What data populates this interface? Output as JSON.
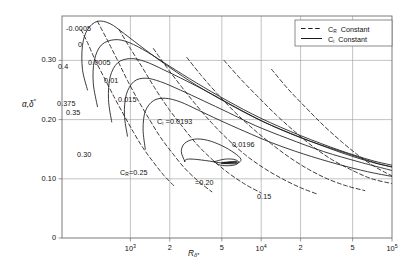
{
  "figure": {
    "kind": "neutral-stability-diagram",
    "background": "#ffffff",
    "line_color": "#1a1a1a",
    "grid_color": "#9a9a9a",
    "frame_color": "#6e6e6e"
  },
  "axes": {
    "y_title": "αᵢδ*",
    "y_title_plain": "α,δ*",
    "x_title_main": "R",
    "x_title_sub": "δ*",
    "y_ticks": [
      "0",
      "0.10",
      "0.20",
      "0.30"
    ],
    "y_tick_values": [
      0,
      0.1,
      0.2,
      0.3
    ],
    "y_min": 0,
    "y_max": 0.375,
    "x_tick_labels": [
      "10³",
      "2",
      "5",
      "10⁴",
      "2",
      "5",
      "10⁵"
    ],
    "x_tick_values": [
      1000,
      2000,
      5000,
      10000,
      20000,
      50000,
      100000
    ],
    "x_min": 300,
    "x_max": 100000,
    "x_scale": "log",
    "grid": true
  },
  "legend": {
    "entries": [
      {
        "style": "dashed",
        "symbol": "C",
        "sub": "R",
        "text": "Constant"
      },
      {
        "style": "solid",
        "symbol": "C",
        "sub": "i",
        "text": "Constant"
      }
    ]
  },
  "curve_labels": {
    "ci_solid": [
      "-0.0005",
      "0",
      "0.0005",
      "0.01",
      "0.015"
    ],
    "ci_named": "Cᵢ =0.0193",
    "ci_inner": "0.0196",
    "cr_dashed": [
      "0.4",
      "0.375",
      "0.35",
      "0.30"
    ],
    "cr_named": "Cʀ=0.25",
    "cr_more": [
      "=0.20",
      "0.15"
    ]
  },
  "chart_data": {
    "type": "line",
    "title": "",
    "xlabel": "R_delta*",
    "ylabel": "alpha,delta*",
    "xlim": [
      300,
      100000
    ],
    "ylim": [
      0,
      0.375
    ],
    "xscale": "log",
    "grid": true,
    "legend": [
      "C_R Constant (dashed)",
      "C_i Constant (solid)"
    ],
    "series": [
      {
        "name": "C_i = -0.0005",
        "style": "solid",
        "label": "-0.0005",
        "points": [
          [
            470,
            0.25
          ],
          [
            430,
            0.285
          ],
          [
            430,
            0.325
          ],
          [
            470,
            0.352
          ],
          [
            560,
            0.366
          ],
          [
            700,
            0.362
          ],
          [
            900,
            0.345
          ],
          [
            1300,
            0.318
          ],
          [
            2000,
            0.288
          ],
          [
            3200,
            0.258
          ],
          [
            5500,
            0.228
          ],
          [
            10000,
            0.198
          ],
          [
            20000,
            0.17
          ],
          [
            40000,
            0.145
          ],
          [
            70000,
            0.128
          ],
          [
            100000,
            0.12
          ]
        ]
      },
      {
        "name": "C_i = 0",
        "style": "solid",
        "label": "0",
        "points": [
          [
            560,
            0.222
          ],
          [
            520,
            0.262
          ],
          [
            530,
            0.3
          ],
          [
            600,
            0.326
          ],
          [
            760,
            0.335
          ],
          [
            980,
            0.33
          ],
          [
            1350,
            0.314
          ],
          [
            2000,
            0.29
          ],
          [
            3200,
            0.262
          ],
          [
            5500,
            0.232
          ],
          [
            10000,
            0.202
          ],
          [
            20000,
            0.173
          ],
          [
            40000,
            0.148
          ],
          [
            70000,
            0.131
          ],
          [
            100000,
            0.123
          ]
        ]
      },
      {
        "name": "C_i = 0.0005",
        "style": "solid",
        "label": "0.0005",
        "points": [
          [
            720,
            0.196
          ],
          [
            680,
            0.234
          ],
          [
            700,
            0.272
          ],
          [
            800,
            0.296
          ],
          [
            1000,
            0.303
          ],
          [
            1300,
            0.298
          ],
          [
            1800,
            0.284
          ],
          [
            2700,
            0.265
          ],
          [
            4200,
            0.243
          ],
          [
            7000,
            0.216
          ],
          [
            12000,
            0.19
          ],
          [
            22000,
            0.166
          ],
          [
            45000,
            0.143
          ],
          [
            75000,
            0.127
          ],
          [
            100000,
            0.12
          ]
        ]
      },
      {
        "name": "C_i = 0.01",
        "style": "solid",
        "label": "0.01",
        "points": [
          [
            950,
            0.172
          ],
          [
            900,
            0.208
          ],
          [
            930,
            0.242
          ],
          [
            1060,
            0.264
          ],
          [
            1300,
            0.27
          ],
          [
            1700,
            0.264
          ],
          [
            2400,
            0.25
          ],
          [
            3600,
            0.232
          ],
          [
            5600,
            0.212
          ],
          [
            9000,
            0.19
          ],
          [
            16000,
            0.168
          ],
          [
            30000,
            0.146
          ],
          [
            55000,
            0.129
          ],
          [
            85000,
            0.118
          ],
          [
            100000,
            0.114
          ]
        ]
      },
      {
        "name": "C_i = 0.015",
        "style": "solid",
        "label": "0.015",
        "points": [
          [
            1300,
            0.15
          ],
          [
            1250,
            0.184
          ],
          [
            1300,
            0.214
          ],
          [
            1500,
            0.232
          ],
          [
            1850,
            0.236
          ],
          [
            2400,
            0.23
          ],
          [
            3300,
            0.216
          ],
          [
            4800,
            0.199
          ],
          [
            7500,
            0.18
          ],
          [
            12000,
            0.161
          ],
          [
            21000,
            0.142
          ],
          [
            38000,
            0.125
          ],
          [
            65000,
            0.112
          ],
          [
            100000,
            0.104
          ]
        ]
      },
      {
        "name": "C_i = 0.0193",
        "style": "solid",
        "label": "C_i =0.0193",
        "points": [
          [
            2600,
            0.13
          ],
          [
            2450,
            0.146
          ],
          [
            2600,
            0.16
          ],
          [
            3100,
            0.167
          ],
          [
            3900,
            0.165
          ],
          [
            5000,
            0.156
          ],
          [
            6200,
            0.144
          ],
          [
            7000,
            0.133
          ],
          [
            6500,
            0.126
          ],
          [
            5200,
            0.126
          ],
          [
            4000,
            0.13
          ],
          [
            3100,
            0.133
          ],
          [
            2700,
            0.133
          ],
          [
            2600,
            0.13
          ]
        ]
      },
      {
        "name": "C_i = 0.0196",
        "style": "solid",
        "label": "0.0196",
        "points": [
          [
            4400,
            0.129
          ],
          [
            5200,
            0.133
          ],
          [
            6100,
            0.133
          ],
          [
            6700,
            0.129
          ],
          [
            6400,
            0.124
          ],
          [
            5500,
            0.122
          ],
          [
            4700,
            0.124
          ],
          [
            4400,
            0.129
          ]
        ]
      },
      {
        "name": "C_R = 0.4",
        "style": "dashed",
        "label": "0.4",
        "points": [
          [
            420,
            0.352
          ],
          [
            470,
            0.33
          ],
          [
            540,
            0.3
          ],
          [
            640,
            0.268
          ],
          [
            760,
            0.236
          ],
          [
            900,
            0.206
          ],
          [
            1060,
            0.178
          ],
          [
            1250,
            0.152
          ],
          [
            1500,
            0.128
          ],
          [
            1800,
            0.106
          ],
          [
            2200,
            0.086
          ]
        ]
      },
      {
        "name": "C_R = 0.375",
        "style": "dashed",
        "label": "0.375",
        "points": [
          [
            560,
            0.366
          ],
          [
            660,
            0.336
          ],
          [
            790,
            0.302
          ],
          [
            950,
            0.266
          ],
          [
            1150,
            0.232
          ],
          [
            1400,
            0.2
          ],
          [
            1700,
            0.17
          ],
          [
            2100,
            0.143
          ],
          [
            2600,
            0.118
          ],
          [
            3300,
            0.096
          ],
          [
            4200,
            0.078
          ]
        ]
      },
      {
        "name": "C_R = 0.35",
        "style": "dashed",
        "label": "0.35",
        "points": [
          [
            820,
            0.352
          ],
          [
            1000,
            0.32
          ],
          [
            1250,
            0.286
          ],
          [
            1550,
            0.252
          ],
          [
            1950,
            0.219
          ],
          [
            2500,
            0.188
          ],
          [
            3200,
            0.159
          ],
          [
            4200,
            0.133
          ],
          [
            5600,
            0.11
          ],
          [
            7500,
            0.091
          ],
          [
            10000,
            0.076
          ]
        ]
      },
      {
        "name": "C_R = 0.30",
        "style": "dashed",
        "label": "0.30",
        "points": [
          [
            1500,
            0.32
          ],
          [
            1900,
            0.288
          ],
          [
            2450,
            0.256
          ],
          [
            3200,
            0.224
          ],
          [
            4200,
            0.194
          ],
          [
            5600,
            0.166
          ],
          [
            7600,
            0.14
          ],
          [
            10500,
            0.118
          ],
          [
            14500,
            0.1
          ],
          [
            20000,
            0.085
          ],
          [
            27000,
            0.074
          ]
        ]
      },
      {
        "name": "C_R = 0.25",
        "style": "dashed",
        "label": "C_R=0.25",
        "points": [
          [
            2700,
            0.305
          ],
          [
            3500,
            0.274
          ],
          [
            4600,
            0.244
          ],
          [
            6200,
            0.214
          ],
          [
            8500,
            0.186
          ],
          [
            11800,
            0.16
          ],
          [
            16500,
            0.136
          ],
          [
            23000,
            0.116
          ],
          [
            32000,
            0.1
          ],
          [
            45000,
            0.088
          ],
          [
            62000,
            0.08
          ]
        ]
      },
      {
        "name": "C_R = 0.20",
        "style": "dashed",
        "label": "=0.20",
        "points": [
          [
            5200,
            0.3
          ],
          [
            7000,
            0.268
          ],
          [
            9500,
            0.238
          ],
          [
            13000,
            0.208
          ],
          [
            18000,
            0.18
          ],
          [
            25000,
            0.154
          ],
          [
            35000,
            0.132
          ],
          [
            50000,
            0.114
          ],
          [
            70000,
            0.1
          ],
          [
            100000,
            0.092
          ]
        ]
      },
      {
        "name": "C_R = 0.15",
        "style": "dashed",
        "label": "0.15",
        "points": [
          [
            12000,
            0.285
          ],
          [
            16000,
            0.252
          ],
          [
            22000,
            0.22
          ],
          [
            30000,
            0.19
          ],
          [
            41000,
            0.163
          ],
          [
            55000,
            0.14
          ],
          [
            72000,
            0.122
          ],
          [
            90000,
            0.11
          ],
          [
            100000,
            0.105
          ]
        ]
      }
    ]
  }
}
